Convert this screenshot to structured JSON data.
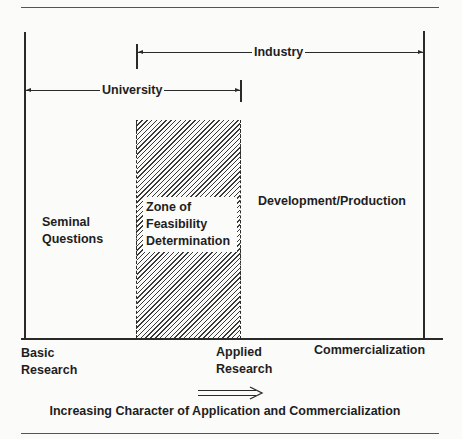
{
  "diagram": {
    "ranges": {
      "industry": {
        "label": "Industry"
      },
      "university": {
        "label": "University"
      }
    },
    "regions": {
      "seminal": {
        "line1": "Seminal",
        "line2": "Questions"
      },
      "zone": {
        "line1": "Zone of",
        "line2": "Feasibility",
        "line3": "Determination"
      },
      "development": {
        "label": "Development/Production"
      }
    },
    "axis_labels": {
      "basic": {
        "line1": "Basic",
        "line2": "Research"
      },
      "applied": {
        "line1": "Applied",
        "line2": "Research"
      },
      "commercialization": {
        "label": "Commercialization"
      }
    },
    "direction_arrow": {
      "glyph": "⟹"
    },
    "caption": "Increasing Character of Application and Commercialization",
    "colors": {
      "ink": "#1e1e1e",
      "paper": "#fbfbfa"
    }
  }
}
